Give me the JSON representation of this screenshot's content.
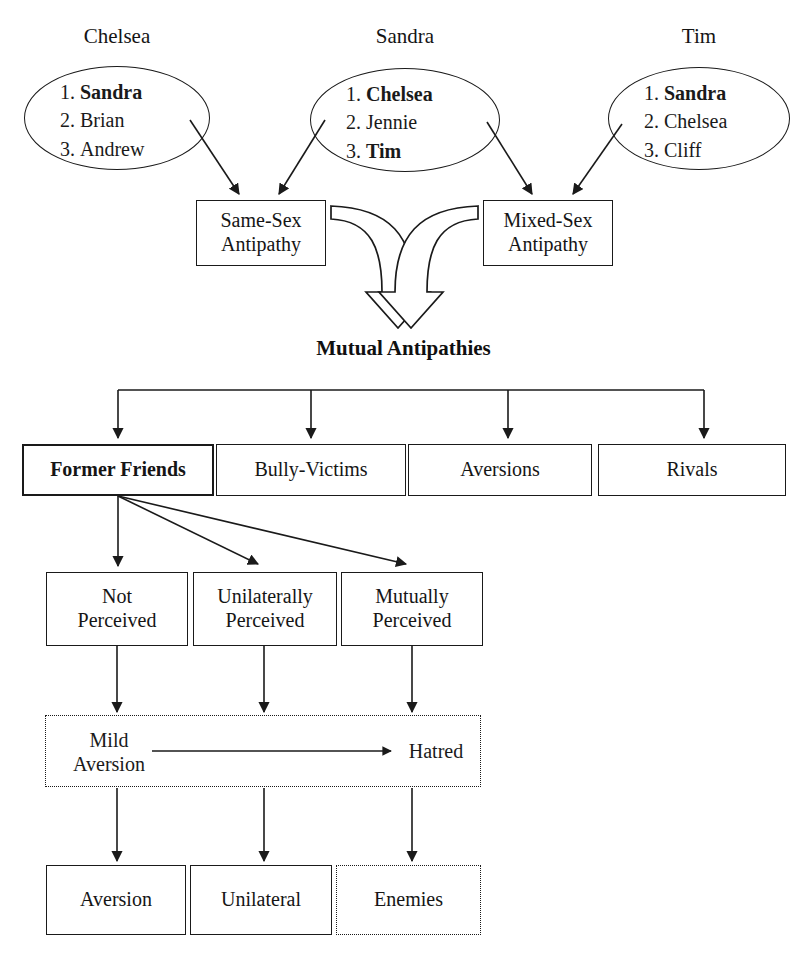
{
  "nominators": [
    {
      "name": "Chelsea",
      "choices": [
        {
          "rank": "1.",
          "name": "Sandra",
          "bold": true
        },
        {
          "rank": "2.",
          "name": "Brian",
          "bold": false
        },
        {
          "rank": "3.",
          "name": "Andrew",
          "bold": false
        }
      ]
    },
    {
      "name": "Sandra",
      "choices": [
        {
          "rank": "1.",
          "name": "Chelsea",
          "bold": true
        },
        {
          "rank": "2.",
          "name": "Jennie",
          "bold": false
        },
        {
          "rank": "3.",
          "name": "Tim",
          "bold": true
        }
      ]
    },
    {
      "name": "Tim",
      "choices": [
        {
          "rank": "1.",
          "name": "Sandra",
          "bold": true
        },
        {
          "rank": "2.",
          "name": "Chelsea",
          "bold": false
        },
        {
          "rank": "3.",
          "name": "Cliff",
          "bold": false
        }
      ]
    }
  ],
  "antipathy_types": {
    "same_sex": "Same-Sex\nAntipathy",
    "same_sex_line1": "Same-Sex",
    "same_sex_line2": "Antipathy",
    "mixed_sex_line1": "Mixed-Sex",
    "mixed_sex_line2": "Antipathy"
  },
  "mutual_antipathies_label": "Mutual Antipathies",
  "categories": [
    {
      "label": "Former Friends",
      "bold": true
    },
    {
      "label": "Bully-Victims",
      "bold": false
    },
    {
      "label": "Aversions",
      "bold": false
    },
    {
      "label": "Rivals",
      "bold": false
    }
  ],
  "perception_levels": [
    {
      "line1": "Not",
      "line2": "Perceived"
    },
    {
      "line1": "Unilaterally",
      "line2": "Perceived"
    },
    {
      "line1": "Mutually",
      "line2": "Perceived"
    }
  ],
  "intensity": {
    "left_line1": "Mild",
    "left_line2": "Aversion",
    "right": "Hatred"
  },
  "outcomes": [
    {
      "label": "Aversion",
      "dotted": false
    },
    {
      "label": "Unilateral",
      "dotted": false
    },
    {
      "label": "Enemies",
      "dotted": true
    }
  ],
  "colors": {
    "stroke": "#1a1a1a",
    "text": "#151515",
    "background": "#ffffff"
  }
}
